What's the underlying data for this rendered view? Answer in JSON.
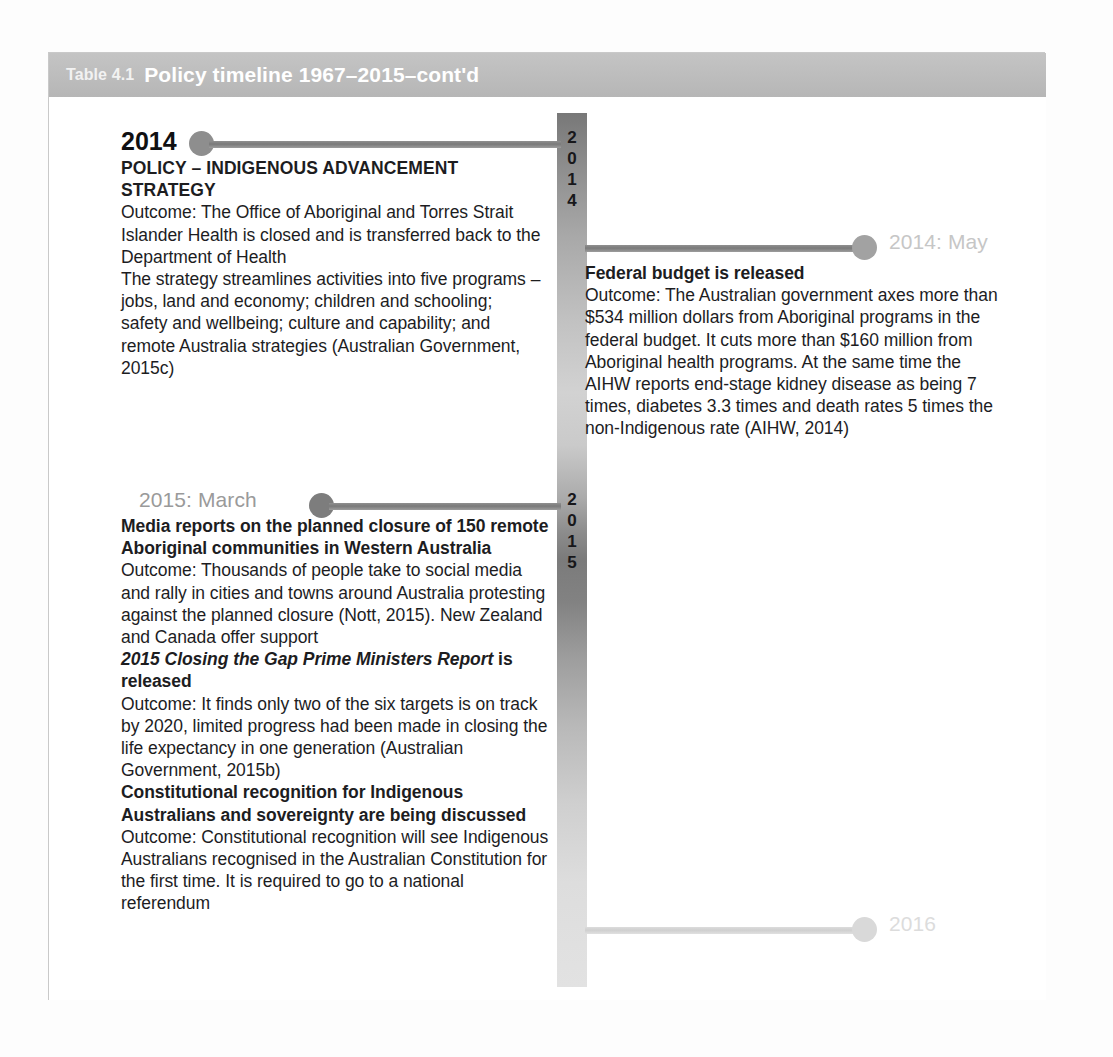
{
  "figure": {
    "caption_number": "Table 4.1",
    "caption_title": "Policy timeline 1967–2015–cont'd"
  },
  "spine": {
    "year_2014_digits": [
      "2",
      "0",
      "1",
      "4"
    ],
    "year_2015_digits": [
      "2",
      "0",
      "1",
      "5"
    ]
  },
  "events": [
    {
      "id": "event-2014",
      "side": "left",
      "year_label": "2014",
      "heading": "POLICY – INDIGENOUS ADVANCEMENT STRATEGY",
      "paragraphs": [
        "Outcome: The Office of Aboriginal and Torres Strait Islander Health is closed and is transferred back to the Department of Health",
        "The strategy streamlines activities into five programs – jobs, land and economy; children and schooling; safety and wellbeing; culture and capability; and remote Australia strategies (Australian Government, 2015c)"
      ]
    },
    {
      "id": "event-2014-may",
      "side": "right",
      "marker_label": "2014: May",
      "heading": "Federal budget is released",
      "paragraphs": [
        "Outcome: The Australian government axes more than $534 million dollars from Aboriginal programs in the federal budget. It cuts more than $160 million from Aboriginal health programs. At the same time the AIHW reports end-stage kidney disease as being 7 times, diabetes 3.3 times and death rates 5 times the non-Indigenous rate (AIHW, 2014)"
      ]
    },
    {
      "id": "event-2015-march",
      "side": "left",
      "marker_label": "2015: March",
      "entries": [
        {
          "heading": "Media reports on the planned closure of 150 remote Aboriginal communities in Western Australia",
          "body": "Outcome: Thousands of people take to social media and rally in cities and towns around Australia protesting against the planned closure (Nott, 2015). New Zealand and Canada offer support"
        },
        {
          "heading_italic": "2015 Closing the Gap Prime Ministers Report",
          "heading_rest": " is released",
          "body": "Outcome: It finds only two of the six targets is on track by 2020, limited progress had been made in closing the life expectancy in one generation (Australian Government, 2015b)"
        },
        {
          "heading": "Constitutional recognition for Indigenous Australians and sovereignty are being discussed",
          "body": "Outcome: Constitutional recognition will see Indigenous Australians recognised in the Australian Constitution for the first time. It is required to go to a national referendum"
        }
      ]
    },
    {
      "id": "event-2016",
      "side": "right",
      "marker_label": "2016"
    }
  ],
  "colors": {
    "caption_bar": "#bdbdbd",
    "spine_dark": "#7b7b7b",
    "spine_light": "#e2e2e2",
    "dot_default": "#8e8e8e",
    "label_faded": "#c6c6c6",
    "label_future": "#dcdcdc",
    "text": "#1d1d1f"
  }
}
